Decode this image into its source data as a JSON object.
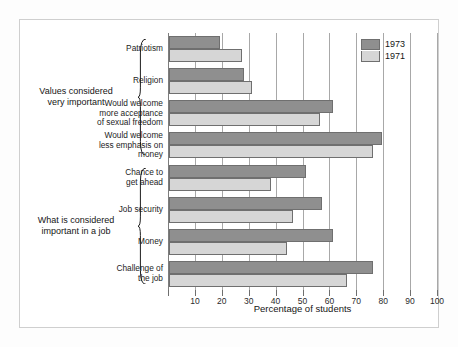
{
  "chart_data": {
    "type": "bar",
    "orientation": "horizontal",
    "title": "",
    "xlabel": "Percentage of students",
    "ylabel": "",
    "xlim": [
      0,
      100
    ],
    "grid": true,
    "legend_position": "top-right",
    "xticks": [
      0,
      10,
      20,
      30,
      40,
      50,
      60,
      70,
      80,
      90,
      100
    ],
    "xtick_labels": [
      "",
      "10",
      "20",
      "30",
      "40",
      "50",
      "60",
      "70",
      "80",
      "90",
      "100"
    ],
    "categories": [
      "Patriotism",
      "Religion",
      "Would welcome more acceptance of sexual freedom",
      "Would welcome less emphasis on money",
      "Chance to get ahead",
      "Job security",
      "Money",
      "Challenge of the job"
    ],
    "category_label_lines": [
      [
        "Patriotism"
      ],
      [
        "Religion"
      ],
      [
        "Would welcome",
        "more acceptance",
        "of sexual freedom"
      ],
      [
        "Would welcome",
        "less emphasis on",
        "money"
      ],
      [
        "Chance to",
        "get ahead"
      ],
      [
        "Job security"
      ],
      [
        "Money"
      ],
      [
        "Challenge of",
        "the job"
      ]
    ],
    "series": [
      {
        "name": "1973",
        "color": "#8f8f8f",
        "values": [
          19,
          28,
          61,
          79,
          51,
          57,
          61,
          76
        ]
      },
      {
        "name": "1971",
        "color": "#d6d6d6",
        "values": [
          27,
          31,
          56,
          76,
          38,
          46,
          44,
          66
        ]
      }
    ],
    "groups": [
      {
        "label_lines": [
          "Values considered",
          "very important"
        ],
        "category_indices": [
          0,
          1,
          2,
          3
        ]
      },
      {
        "label_lines": [
          "What is considered",
          "important in a job"
        ],
        "category_indices": [
          4,
          5,
          6,
          7
        ]
      }
    ]
  },
  "legend": {
    "entries": [
      {
        "label": "1973",
        "color": "#8f8f8f"
      },
      {
        "label": "1971",
        "color": "#d6d6d6"
      }
    ]
  },
  "colors": {
    "series_1973": "#8f8f8f",
    "series_1971": "#d6d6d6",
    "gridline": "#a8a8a8",
    "bar_outline": "#6f6f6f",
    "frame": "#cfcfcf",
    "background": "#ffffff"
  }
}
